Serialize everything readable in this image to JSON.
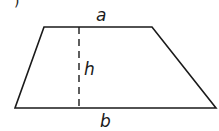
{
  "diagram": {
    "shape": "trapezoid",
    "labels": {
      "top_side": "a",
      "height": "h",
      "bottom_side": "b"
    },
    "partial_corner_mark": ")",
    "colors": {
      "stroke": "#1a1a1a",
      "background": "#ffffff"
    }
  }
}
